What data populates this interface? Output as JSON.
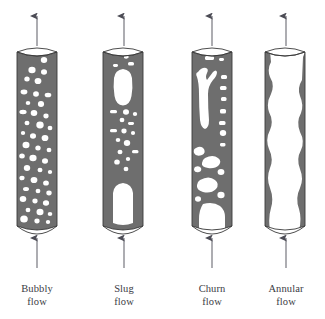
{
  "figure": {
    "background_color": "#ffffff",
    "fluid_color": "#6e6e6e",
    "gas_color": "#ffffff",
    "outline_color": "#3a3a3a",
    "arrow_color": "#5a5a62",
    "text_color": "#3b3b44",
    "flow_direction": "upward"
  },
  "regimes": [
    {
      "id": "bubbly",
      "label_line1": "Bubbly",
      "label_line2": "flow",
      "pipe_x": 17,
      "pipe_width": 40,
      "pipe_top": 48,
      "pipe_bottom": 230,
      "label_x": -6,
      "label_y": 284,
      "gas_fraction_description": "many small dispersed bubbles",
      "arrow_top_x": 37,
      "arrow_bottom_x": 37
    },
    {
      "id": "slug",
      "label_line1": "Slug",
      "label_line2": "flow",
      "pipe_x": 103,
      "pipe_width": 40,
      "pipe_top": 48,
      "pipe_bottom": 230,
      "label_x": 78,
      "label_y": 284,
      "gas_fraction_description": "large Taylor bubbles separated by liquid slugs",
      "arrow_top_x": 124,
      "arrow_bottom_x": 124
    },
    {
      "id": "churn",
      "label_line1": "Churn",
      "label_line2": "flow",
      "pipe_x": 192,
      "pipe_width": 40,
      "pipe_top": 48,
      "pipe_bottom": 230,
      "label_x": 167,
      "label_y": 284,
      "gas_fraction_description": "chaotic distorted elongated bubbles",
      "arrow_top_x": 212,
      "arrow_bottom_x": 212
    },
    {
      "id": "annular",
      "label_line1": "Annular",
      "label_line2": "flow",
      "pipe_x": 265,
      "pipe_width": 40,
      "pipe_top": 48,
      "pipe_bottom": 230,
      "label_x": 240,
      "label_y": 284,
      "gas_fraction_description": "continuous gas core with thin wavy liquid film on walls",
      "arrow_top_x": 286,
      "arrow_bottom_x": 286
    }
  ]
}
